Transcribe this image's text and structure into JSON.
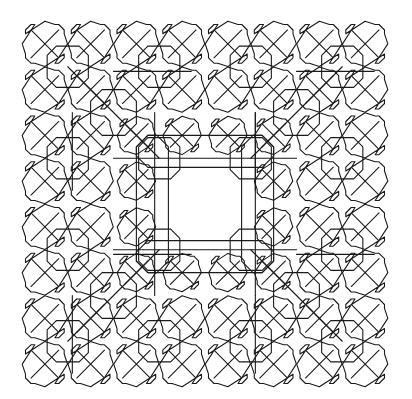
{
  "figure": {
    "kind": "fractal-line-pattern",
    "canvas": {
      "width": 412,
      "height": 399,
      "background": "#ffffff"
    },
    "bounds": {
      "x": 22,
      "y": 21,
      "size": 366
    },
    "stroke_color": "#1a1a1a",
    "stroke_width": 1.1,
    "grid_cells": 8,
    "recursion_levels": 3
  }
}
